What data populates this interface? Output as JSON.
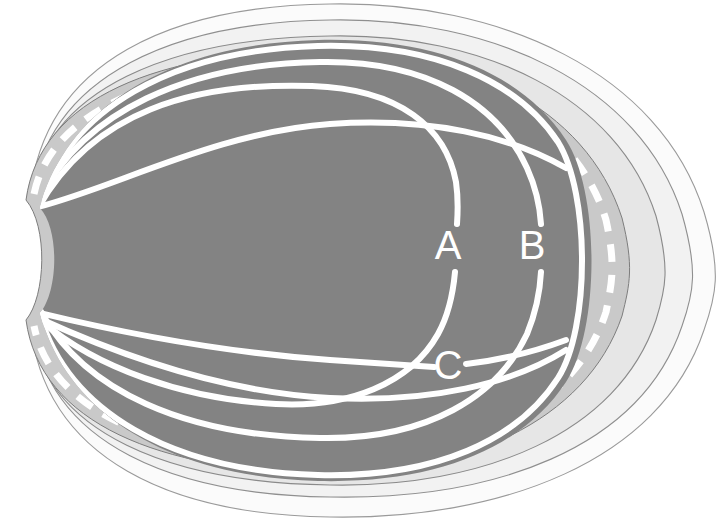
{
  "figure": {
    "background_color": "#ffffff",
    "width": 723,
    "height": 521
  },
  "labels": [
    {
      "id": "A",
      "text": "A",
      "x": 448,
      "y": 248,
      "color": "#ffffff"
    },
    {
      "id": "B",
      "text": "B",
      "x": 532,
      "y": 248,
      "color": "#ffffff"
    },
    {
      "id": "C",
      "text": "C",
      "x": 448,
      "y": 368,
      "color": "#ffffff"
    }
  ],
  "layers": [
    {
      "name": "outer-rim",
      "fill": "#fbfbfb",
      "stroke": "#9a9a9a",
      "stroke_width": 1.1
    },
    {
      "name": "outer-pale-band",
      "fill": "#f2f2f2",
      "stroke": "#8f8f8f",
      "stroke_width": 1.1
    },
    {
      "name": "light-gray-band",
      "fill": "#e6e6e6",
      "stroke": "#8a8a8a",
      "stroke_width": 1.1
    },
    {
      "name": "mid-gray-band",
      "fill": "#c9c9c9",
      "stroke": "#7d7d7d",
      "stroke_width": 1.0
    },
    {
      "name": "inner-core",
      "fill": "#838383",
      "stroke": "none",
      "stroke_width": 0
    }
  ],
  "curves": [
    {
      "name": "dashed-boundary",
      "style": "dashed",
      "color": "#ffffff",
      "width": 7,
      "dash": "18 13"
    },
    {
      "name": "curve-a",
      "style": "solid",
      "color": "#ffffff",
      "width": 6
    },
    {
      "name": "curve-b",
      "style": "solid",
      "color": "#ffffff",
      "width": 6
    },
    {
      "name": "curve-c",
      "style": "solid",
      "color": "#ffffff",
      "width": 6
    },
    {
      "name": "curve-upper-inner",
      "style": "solid",
      "color": "#ffffff",
      "width": 6
    },
    {
      "name": "curve-lower-inner",
      "style": "solid",
      "color": "#ffffff",
      "width": 6
    },
    {
      "name": "curve-mid-long",
      "style": "solid",
      "color": "#ffffff",
      "width": 6
    }
  ],
  "colors": {
    "core_gray": "#838383",
    "mid_gray": "#c9c9c9",
    "light_gray": "#e6e6e6",
    "pale_gray": "#f2f2f2",
    "rim_white": "#fbfbfb",
    "line_white": "#ffffff",
    "outline_gray": "#8f8f8f"
  }
}
